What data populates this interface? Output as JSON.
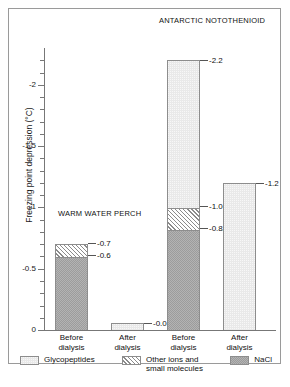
{
  "chart_data": {
    "type": "bar",
    "subtype": "stacked-bar",
    "title": "",
    "xlabel": "",
    "ylabel": "Freezing point depression (°C)",
    "ylim": [
      0,
      -2.3
    ],
    "yticks": [
      "0",
      "-0.5",
      "-1",
      "-1.5",
      "-2"
    ],
    "ytick_values": [
      0,
      -0.5,
      -1,
      -1.5,
      -2
    ],
    "minor_tick_step": 0.1,
    "grid": false,
    "legend_position": "bottom",
    "categories": [
      "Before dialysis",
      "After dialysis",
      "Before dialysis",
      "After dialysis"
    ],
    "groups": [
      {
        "name": "WARM WATER PERCH",
        "categories": [
          "Before dialysis",
          "After dialysis"
        ]
      },
      {
        "name": "ANTARCTIC NOTOTHENIOID",
        "categories": [
          "Before dialysis",
          "After dialysis"
        ]
      }
    ],
    "series": [
      {
        "name": "Glycopeptides",
        "values": [
          0,
          -0.01,
          -1.2,
          -1.2
        ],
        "color": "#e9e9e9"
      },
      {
        "name": "Other ions and small molecules",
        "values": [
          -0.1,
          0,
          -0.18,
          0
        ],
        "color": "#ffffff"
      },
      {
        "name": "NaCl",
        "values": [
          -0.6,
          0,
          -0.82,
          0
        ],
        "color": "#b3b3b3"
      }
    ],
    "bars": [
      {
        "label": "Before dialysis",
        "group": "WARM WATER PERCH",
        "total": -0.7,
        "segments": [
          {
            "series": "NaCl",
            "from": 0,
            "to": -0.6,
            "label": "-0.6"
          },
          {
            "series": "Other ions and small molecules",
            "from": -0.6,
            "to": -0.7,
            "label": "-0.7"
          }
        ]
      },
      {
        "label": "After dialysis",
        "group": "WARM WATER PERCH",
        "total": -0.01,
        "segments": [
          {
            "series": "Glycopeptides",
            "from": 0,
            "to": -0.01,
            "label": "-0.01"
          }
        ]
      },
      {
        "label": "Before dialysis",
        "group": "ANTARCTIC NOTOTHENIOID",
        "total": -2.2,
        "segments": [
          {
            "series": "NaCl",
            "from": 0,
            "to": -0.82,
            "label": "-0.82"
          },
          {
            "series": "Other ions and small molecules",
            "from": -0.82,
            "to": -1.0,
            "label": "-1.0"
          },
          {
            "series": "Glycopeptides",
            "from": -1.0,
            "to": -2.2,
            "label": "-2.2"
          }
        ]
      },
      {
        "label": "After dialysis",
        "group": "ANTARCTIC NOTOTHENIOID",
        "total": -1.2,
        "segments": [
          {
            "series": "Glycopeptides",
            "from": 0,
            "to": -1.2,
            "label": "-1.2"
          }
        ]
      }
    ],
    "annotations": [
      "-0.7",
      "-0.6",
      "-0.01",
      "-2.2",
      "-1.0",
      "-0.82",
      "-1.2"
    ]
  },
  "axis": {
    "y_label": "Freezing point depression (°C)",
    "ticks": [
      {
        "value": -2,
        "label": "-2"
      },
      {
        "value": -1.5,
        "label": "-1.5"
      },
      {
        "value": -1,
        "label": "-1"
      },
      {
        "value": -0.5,
        "label": "-0.5"
      },
      {
        "value": 0,
        "label": "0"
      }
    ]
  },
  "group_titles": {
    "perch": "WARM WATER PERCH",
    "nototheniod": "ANTARCTIC NOTOTHENIOID"
  },
  "xticks": [
    {
      "line1": "Before",
      "line2": "dialysis"
    },
    {
      "line1": "After",
      "line2": "dialysis"
    },
    {
      "line1": "Before",
      "line2": "dialysis"
    },
    {
      "line1": "After",
      "line2": "dialysis"
    }
  ],
  "values": {
    "b1_top": "-0.7",
    "b1_mid": "-0.6",
    "b2_top": "-0.01",
    "b3_top": "-2.2",
    "b3_mid": "-1.0",
    "b3_low": "-0.82",
    "b4_top": "-1.2"
  },
  "legend": {
    "items": [
      {
        "label": "Glycopeptides",
        "swatch": "glyco"
      },
      {
        "label": "Other ions and\nsmall molecules",
        "swatch": "other"
      },
      {
        "label": "NaCl",
        "swatch": "nacl"
      }
    ]
  }
}
